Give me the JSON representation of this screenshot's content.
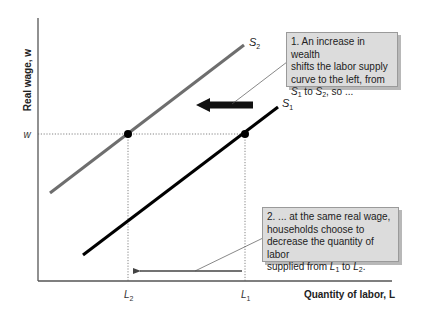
{
  "diagram": {
    "type": "labor-supply-shift",
    "y_axis_title": "Real wage, w",
    "x_axis_title": "Quantity of labor, L",
    "y_tick": "w",
    "x_ticks": [
      {
        "base": "L",
        "sub": "2"
      },
      {
        "base": "L",
        "sub": "1"
      }
    ],
    "curves": [
      {
        "name": "S1",
        "base": "S",
        "sub": "1",
        "color": "#000000"
      },
      {
        "name": "S2",
        "base": "S",
        "sub": "2",
        "color": "#6e6e6e"
      }
    ],
    "points": [
      {
        "name": "equilibrium-S2",
        "on": "S2",
        "x_label": "L2",
        "y_label": "w"
      },
      {
        "name": "equilibrium-S1",
        "on": "S1",
        "x_label": "L1",
        "y_label": "w"
      }
    ],
    "shift_arrow": {
      "direction": "left",
      "from": "S1",
      "to": "S2"
    },
    "quantity_arrow": {
      "direction": "left",
      "from": "L1",
      "to": "L2"
    },
    "callouts": [
      {
        "line1": "1. An increase in wealth",
        "line2": "shifts the labor supply",
        "line3": "curve to the left, from",
        "line4_a": "S",
        "line4_a_sub": "1",
        "line4_b": " to ",
        "line4_c": "S",
        "line4_c_sub": "2",
        "line4_d": ", so ..."
      },
      {
        "line1": "2. ... at the same real wage,",
        "line2": "households choose to",
        "line3": "decrease the quantity of labor",
        "line4_pre": "supplied from ",
        "line4_a": "L",
        "line4_a_sub": "1",
        "line4_b": " to ",
        "line4_c": "L",
        "line4_c_sub": "2",
        "line4_d": "."
      }
    ],
    "colors": {
      "s1": "#000000",
      "s2": "#6e6e6e",
      "axes": "#555555",
      "callout_bg": "#dcdcdc",
      "shift_arrow": "#111111"
    }
  }
}
